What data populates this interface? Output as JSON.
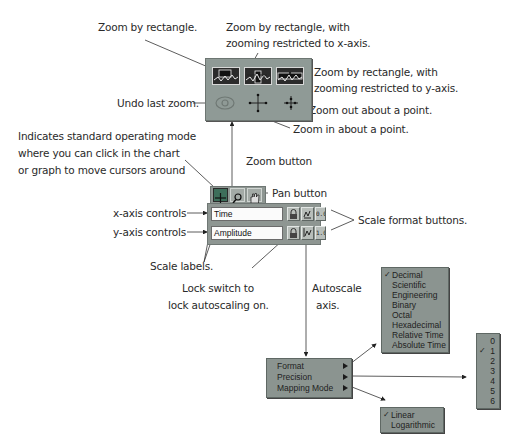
{
  "annotations": {
    "zoom_rect": "Zoom by rectangle.",
    "zoom_rect_x_line1": "Zoom by rectangle, with",
    "zoom_rect_x_line2": "zooming restricted to x-axis.",
    "zoom_rect_y_line1": "Zoom by rectangle, with",
    "zoom_rect_y_line2": "zooming restricted to y-axis.",
    "undo_zoom": "Undo last zoom.",
    "zoom_out": "Zoom out about a point.",
    "zoom_in": "Zoom in about a point.",
    "standard_mode_line1": "Indicates standard operating mode",
    "standard_mode_line2": "where you can click in the chart",
    "standard_mode_line3": "or graph to move cursors around",
    "zoom_button": "Zoom button",
    "pan_button": "Pan button",
    "x_axis_controls": "x-axis controls",
    "y_axis_controls": "y-axis controls",
    "scale_format_buttons": "Scale format buttons.",
    "scale_labels": "Scale labels.",
    "lock_switch_line1": "Lock switch to",
    "lock_switch_line2": "lock autoscaling on.",
    "autoscale_line1": "Autoscale",
    "autoscale_line2": "axis."
  },
  "scale_legend": {
    "x_axis_label": "Time",
    "y_axis_label": "Amplitude",
    "x_format_button": "0.0",
    "y_format_button": "1.0"
  },
  "scale_menu": {
    "items": [
      {
        "label": "Format"
      },
      {
        "label": "Precision"
      },
      {
        "label": "Mapping Mode"
      }
    ]
  },
  "format_menu": {
    "checked": "Decimal",
    "items": [
      {
        "label": "Decimal",
        "check": "✓"
      },
      {
        "label": "Scientific",
        "check": ""
      },
      {
        "label": "Engineering",
        "check": ""
      },
      {
        "label": "Binary",
        "check": ""
      },
      {
        "label": "Octal",
        "check": ""
      },
      {
        "label": "Hexadecimal",
        "check": ""
      },
      {
        "label": "Relative Time",
        "check": ""
      },
      {
        "label": "Absolute Time",
        "check": ""
      }
    ]
  },
  "precision_menu": {
    "checked": "1",
    "items": [
      {
        "label": "0",
        "check": ""
      },
      {
        "label": "1",
        "check": "✓"
      },
      {
        "label": "2",
        "check": ""
      },
      {
        "label": "3",
        "check": ""
      },
      {
        "label": "4",
        "check": ""
      },
      {
        "label": "5",
        "check": ""
      },
      {
        "label": "6",
        "check": ""
      }
    ]
  },
  "mapping_menu": {
    "checked": "Linear",
    "items": [
      {
        "label": "Linear",
        "check": "✓"
      },
      {
        "label": "Logarithmic",
        "check": ""
      }
    ]
  },
  "colors": {
    "panel_gray": "#8e9692",
    "field_bg": "#fbfbfb",
    "active_mode": "#3d6e5a"
  }
}
